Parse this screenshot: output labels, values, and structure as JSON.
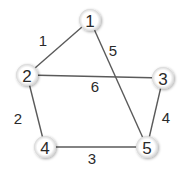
{
  "diagram": {
    "type": "weighted-undirected-graph",
    "nodes": [
      {
        "id": "1",
        "label": "1",
        "x": 90,
        "y": 20
      },
      {
        "id": "2",
        "label": "2",
        "x": 27,
        "y": 75
      },
      {
        "id": "3",
        "label": "3",
        "x": 163,
        "y": 78
      },
      {
        "id": "4",
        "label": "4",
        "x": 45,
        "y": 147
      },
      {
        "id": "5",
        "label": "5",
        "x": 147,
        "y": 147
      }
    ],
    "edges": [
      {
        "from": "1",
        "to": "2",
        "weight": "1",
        "label_x": 43,
        "label_y": 40
      },
      {
        "from": "1",
        "to": "5",
        "weight": "5",
        "label_x": 113,
        "label_y": 50
      },
      {
        "from": "2",
        "to": "3",
        "weight": "6",
        "label_x": 95,
        "label_y": 86
      },
      {
        "from": "2",
        "to": "4",
        "weight": "2",
        "label_x": 18,
        "label_y": 118
      },
      {
        "from": "3",
        "to": "5",
        "weight": "4",
        "label_x": 166,
        "label_y": 117
      },
      {
        "from": "4",
        "to": "5",
        "weight": "3",
        "label_x": 92,
        "label_y": 158
      }
    ],
    "colors": {
      "edge": "#5a5a5a",
      "node_fill": "#ffffff",
      "node_shadow": "#c8c8c8",
      "text": "#2a2a2a"
    }
  }
}
